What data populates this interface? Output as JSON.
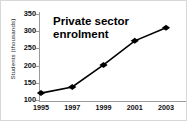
{
  "chart_data": {
    "type": "line",
    "title": "Private sector\nenrolment",
    "title_plain": "Private sector enrolment",
    "xlabel": "",
    "ylabel": "Students (thousands)",
    "categories": [
      "1995",
      "1997",
      "1999",
      "2001",
      "2003"
    ],
    "x": [
      1995,
      1997,
      1999,
      2001,
      2003
    ],
    "values": [
      120,
      138,
      202,
      272,
      310
    ],
    "series": [
      {
        "name": "Private sector enrolment",
        "values": [
          120,
          138,
          202,
          272,
          310
        ]
      }
    ],
    "xlim": [
      1995,
      2003
    ],
    "ylim": [
      100,
      350
    ],
    "y_ticks": [
      100,
      150,
      200,
      250,
      300,
      350
    ],
    "x_ticks": [
      "1995",
      "1997",
      "1999",
      "2001",
      "2003"
    ],
    "grid": false,
    "legend": false,
    "legend_position": "none",
    "marker": "diamond",
    "marker_color": "#000000",
    "line_color": "#000000",
    "axis_color": "#9a9a9a",
    "background_color": "#ffffff",
    "border_color": "#d8d8d8"
  }
}
